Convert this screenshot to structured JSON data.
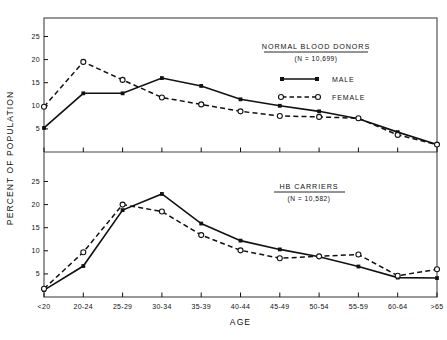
{
  "figure": {
    "axis": {
      "ylabel": "PERCENT OF POPULATION",
      "xlabel": "AGE",
      "categories": [
        "<20",
        "20-24",
        "25-29",
        "30-34",
        "35-39",
        "40-44",
        "45-49",
        "50-54",
        "55-59",
        "60-64",
        ">65"
      ],
      "yticks": [
        "5",
        "10",
        "15",
        "20",
        "25"
      ],
      "ylim": [
        0,
        29
      ]
    },
    "legend": {
      "male_label": "MALE",
      "female_label": "FEMALE"
    },
    "panels": [
      {
        "title": "NORMAL BLOOD DONORS",
        "subtitle": "(N = 10,699)"
      },
      {
        "title": "HB CARRIERS",
        "subtitle": "(N = 10,582)"
      }
    ]
  },
  "chart_data": [
    {
      "type": "line",
      "title": "NORMAL BLOOD DONORS",
      "subtitle": "(N = 10,699)",
      "xlabel": "AGE",
      "ylabel": "PERCENT OF POPULATION",
      "categories": [
        "<20",
        "20-24",
        "25-29",
        "30-34",
        "35-39",
        "40-44",
        "45-49",
        "50-54",
        "55-59",
        "60-64",
        ">65"
      ],
      "ylim": [
        0,
        29
      ],
      "yticks": [
        5,
        10,
        15,
        20,
        25
      ],
      "grid": false,
      "legend_position": "upper-right",
      "series": [
        {
          "name": "MALE",
          "marker": "filled-square",
          "line": "solid",
          "values": [
            5.2,
            12.7,
            12.7,
            16.0,
            14.3,
            11.4,
            10.0,
            8.8,
            7.2,
            4.3,
            1.6
          ]
        },
        {
          "name": "FEMALE",
          "marker": "open-circle",
          "line": "dashed",
          "values": [
            9.8,
            19.5,
            15.6,
            11.8,
            10.3,
            8.8,
            7.8,
            7.6,
            7.3,
            3.7,
            1.6
          ]
        }
      ]
    },
    {
      "type": "line",
      "title": "HB CARRIERS",
      "subtitle": "(N = 10,582)",
      "xlabel": "AGE",
      "ylabel": "PERCENT OF POPULATION",
      "categories": [
        "<20",
        "20-24",
        "25-29",
        "30-34",
        "35-39",
        "40-44",
        "45-49",
        "50-54",
        "55-59",
        "60-64",
        ">65"
      ],
      "ylim": [
        0,
        29
      ],
      "yticks": [
        5,
        10,
        15,
        20,
        25
      ],
      "grid": false,
      "legend_position": "none",
      "series": [
        {
          "name": "MALE",
          "marker": "filled-square",
          "line": "solid",
          "values": [
            1.5,
            6.7,
            18.8,
            22.3,
            15.9,
            12.2,
            10.3,
            8.7,
            6.6,
            4.2,
            4.1
          ]
        },
        {
          "name": "FEMALE",
          "marker": "open-circle",
          "line": "dashed",
          "values": [
            1.8,
            9.7,
            20.0,
            18.5,
            13.4,
            10.1,
            8.4,
            8.8,
            9.2,
            4.6,
            6.0
          ]
        }
      ]
    }
  ]
}
